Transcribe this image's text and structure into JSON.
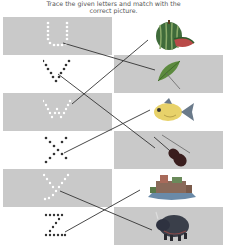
{
  "instruction": {
    "line1": "Trace the given letters and match with the",
    "line2": "correct picture."
  },
  "letters": [
    {
      "char": "u",
      "dot_color": "#ffffff",
      "bg": "gray"
    },
    {
      "char": "v",
      "dot_color": "#333333",
      "bg": "white"
    },
    {
      "char": "w",
      "dot_color": "#ffffff",
      "bg": "gray"
    },
    {
      "char": "x",
      "dot_color": "#333333",
      "bg": "white"
    },
    {
      "char": "y",
      "dot_color": "#ffffff",
      "bg": "gray"
    },
    {
      "char": "z",
      "dot_color": "#333333",
      "bg": "white"
    }
  ],
  "pictures": [
    {
      "name": "watermelon",
      "bg": "white"
    },
    {
      "name": "umbrella",
      "bg": "gray"
    },
    {
      "name": "fish",
      "bg": "white"
    },
    {
      "name": "violin",
      "bg": "gray"
    },
    {
      "name": "yacht",
      "bg": "white"
    },
    {
      "name": "yak",
      "bg": "gray"
    }
  ],
  "matches": [
    {
      "letter": "u",
      "picture": "umbrella"
    },
    {
      "letter": "v",
      "picture": "violin"
    },
    {
      "letter": "w",
      "picture": "watermelon"
    },
    {
      "letter": "x",
      "picture": "fish"
    },
    {
      "letter": "y",
      "picture": "yak"
    },
    {
      "letter": "z",
      "picture": "yacht"
    }
  ],
  "colors": {
    "gray_band": "#c9c9c9",
    "line": "#333333"
  }
}
